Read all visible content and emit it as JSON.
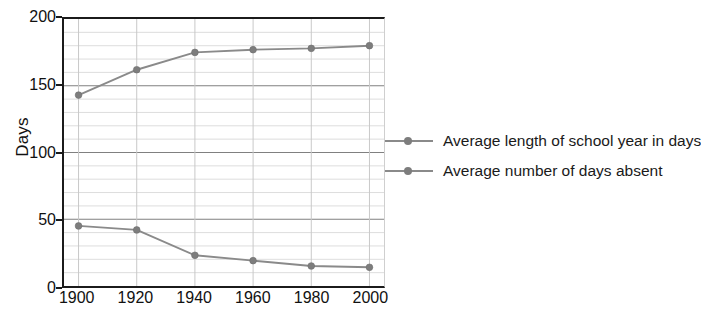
{
  "chart_data": {
    "type": "line",
    "title": "",
    "xlabel": "",
    "ylabel": "Days",
    "x": [
      1900,
      1920,
      1940,
      1960,
      1980,
      2000
    ],
    "categories": [
      "1900",
      "1920",
      "1940",
      "1960",
      "1980",
      "2000"
    ],
    "series": [
      {
        "name": "Average length of school year in days",
        "values": [
          143,
          162,
          175,
          177,
          178,
          180
        ],
        "color": "#8a8a8a"
      },
      {
        "name": "Average number of days absent",
        "values": [
          45,
          42,
          23,
          19,
          15,
          14
        ],
        "color": "#8a8a8a"
      }
    ],
    "xlim": [
      1895,
      2005
    ],
    "ylim": [
      0,
      200
    ],
    "ytick_values": [
      0,
      50,
      100,
      150,
      200
    ],
    "ytick_labels": [
      "0",
      "50",
      "100",
      "150",
      "200"
    ],
    "xtick_labels": [
      "1900",
      "1920",
      "1940",
      "1960",
      "1980",
      "2000"
    ],
    "grid": true,
    "grid_major_step": 50,
    "grid_minor_step": 10,
    "grid_major_color": "#808080",
    "grid_minor_color": "#dcdcdc",
    "vertical_grid_color": "#c8c8c8",
    "axis_color": "#1b1b1b",
    "marker": "circle",
    "legend_position": "right",
    "legend": [
      "Average length of school year in days",
      "Average number of days absent"
    ]
  }
}
